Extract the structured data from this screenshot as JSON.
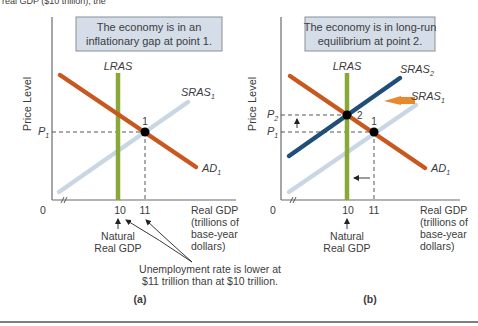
{
  "top_fragment": "real GDP ($10 trillion), the",
  "colors": {
    "ad": "#c9581f",
    "lras": "#8aa83a",
    "sras1": "#c9d6e3",
    "sras2": "#1f4e79",
    "box_fill": "#d4dde8",
    "shift_arrow": "#e8892e",
    "point": "#000000",
    "rule": "#555555"
  },
  "panel_a": {
    "caption": "(a)",
    "box_line1": "The economy is in an",
    "box_line2": "inflationary gap at point 1.",
    "y_axis_label": "Price Level",
    "x_axis_label": [
      "Real GDP",
      "(trillions of",
      "base-year",
      "dollars)"
    ],
    "origin": "0",
    "tick_10": "10",
    "tick_11": "11",
    "p1": "P",
    "p1_sub": "1",
    "lras": "LRAS",
    "sras": "SRAS",
    "sras_sub": "1",
    "ad": "AD",
    "ad_sub": "1",
    "point_label": "1",
    "natural_line1": "Natural",
    "natural_line2": "Real GDP",
    "note_line1": "Unemployment rate is lower at",
    "note_line2": "$11 trillion than at $10 trillion."
  },
  "panel_b": {
    "caption": "(b)",
    "box_line1": "The economy is in long-run",
    "box_line2": "equilibrium at point 2.",
    "y_axis_label": "Price Level",
    "x_axis_label": [
      "Real GDP",
      "(trillions of",
      "base-year",
      "dollars)"
    ],
    "origin": "0",
    "tick_10": "10",
    "tick_11": "11",
    "p1": "P",
    "p1_sub": "1",
    "p2": "P",
    "p2_sub": "2",
    "lras": "LRAS",
    "sras1": "SRAS",
    "sras1_sub": "1",
    "sras2": "SRAS",
    "sras2_sub": "2",
    "ad": "AD",
    "ad_sub": "1",
    "point1_label": "1",
    "point2_label": "2",
    "natural_line1": "Natural",
    "natural_line2": "Real GDP"
  }
}
